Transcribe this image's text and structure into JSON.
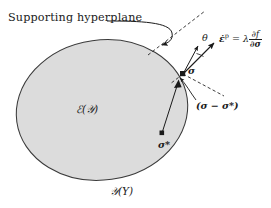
{
  "figure": {
    "type": "diagram",
    "background_color": "#ffffff",
    "line_color": "#1a1a1a",
    "domain_fill_color": "#dcdcdc",
    "domain_stroke_color": "#3a3a3a"
  },
  "labels": {
    "hyperplane": "Supporting hyperplane",
    "elastic_domain": "ℰ(𝒴)",
    "yield_surface": "𝒴(Y)",
    "sigma": "σ",
    "sigma_star": "σ*",
    "theta": "θ",
    "sigma_difference": "(σ − σ*)"
  },
  "equation": {
    "lhs": "ε̇",
    "lhs_superscript": "p",
    "equals": "=",
    "lambda": "λ",
    "numerator": "∂f",
    "denominator": "∂σ",
    "full_text": "ε̇ᵖ = λ ∂f/∂σ"
  },
  "geometry": {
    "ellipse": {
      "cx": 102,
      "cy": 110,
      "rx": 86,
      "ry": 70,
      "rotation_deg": -8
    },
    "tangent_point": {
      "x": 183,
      "y": 74,
      "marker": "filled-square"
    },
    "interior_point": {
      "x": 162,
      "y": 134,
      "marker": "filled-square"
    },
    "hyperplane_dashed_line": {
      "x1": 151,
      "y1": 52,
      "x2": 203,
      "y2": 13
    },
    "normal_arrow_tip": {
      "x": 214,
      "y": 43
    },
    "secondary_arrow_tip": {
      "x": 199,
      "y": 47
    },
    "normal_dashed_ray": {
      "x1": 183,
      "y1": 74,
      "x2": 221,
      "y2": 90
    },
    "curved_callout_arrow_tip": {
      "x": 161,
      "y": 44
    },
    "difference_arrow_tip": {
      "x": 174,
      "y": 92
    }
  }
}
